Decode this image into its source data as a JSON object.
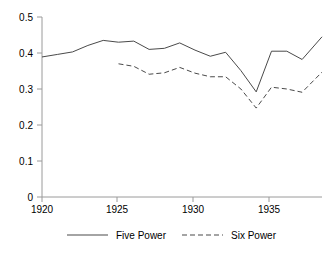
{
  "chart_data": {
    "type": "line",
    "title": "",
    "subtitle": "",
    "xlabel": "",
    "ylabel": "",
    "xlim": [
      1920,
      1938.3
    ],
    "ylim": [
      0,
      0.5
    ],
    "grid": false,
    "legend_position": "bottom",
    "x_ticks": [
      "1920",
      "1925",
      "1930",
      "1935"
    ],
    "x_tick_values": [
      1920,
      1925,
      1930,
      1935
    ],
    "y_ticks": [
      "0",
      "0.1",
      "0.2",
      "0.3",
      "0.4",
      "0.5"
    ],
    "y_tick_values": [
      0,
      0.1,
      0.2,
      0.3,
      0.4,
      0.5
    ],
    "series": [
      {
        "name": "Five Power",
        "style": "solid",
        "color": "#4a4a4a",
        "x": [
          1920,
          1921,
          1922,
          1923,
          1924,
          1925,
          1926,
          1927,
          1928,
          1929,
          1930,
          1931,
          1932,
          1933,
          1934,
          1935,
          1936,
          1937,
          1938.3
        ],
        "values": [
          0.389,
          0.396,
          0.403,
          0.421,
          0.435,
          0.43,
          0.433,
          0.41,
          0.413,
          0.428,
          0.408,
          0.391,
          0.402,
          0.351,
          0.292,
          0.405,
          0.405,
          0.382,
          0.445
        ]
      },
      {
        "name": "Six Power",
        "style": "dashed",
        "color": "#4a4a4a",
        "x": [
          1925,
          1926,
          1927,
          1928,
          1929,
          1930,
          1931,
          1932,
          1933,
          1934,
          1935,
          1936,
          1937,
          1938.3
        ],
        "values": [
          0.37,
          0.363,
          0.341,
          0.345,
          0.36,
          0.344,
          0.334,
          0.334,
          0.3,
          0.247,
          0.305,
          0.3,
          0.291,
          0.347
        ]
      }
    ]
  },
  "legend": {
    "items": [
      {
        "label": "Five Power",
        "style": "solid"
      },
      {
        "label": "Six Power",
        "style": "dashed"
      }
    ]
  },
  "colors": {
    "series": "#4a4a4a",
    "axis": "#9a9a9a",
    "text": "#000000",
    "background": "#ffffff"
  }
}
